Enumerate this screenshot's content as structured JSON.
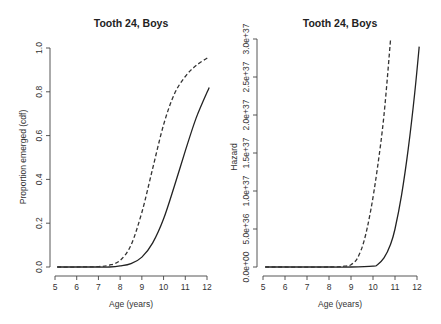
{
  "chart_data": [
    {
      "type": "line",
      "title": "Tooth 24, Boys",
      "xlabel": "Age (years)",
      "ylabel": "Proportion emerged (cdf)",
      "xlim": [
        5,
        12
      ],
      "ylim": [
        0,
        1
      ],
      "x_ticks": [
        "5",
        "6",
        "7",
        "8",
        "9",
        "10",
        "11",
        "12"
      ],
      "y_ticks": [
        "0.0",
        "0.2",
        "0.4",
        "0.6",
        "0.8",
        "1.0"
      ],
      "grid": false,
      "legend": null,
      "x": [
        5.1,
        6,
        7,
        7.5,
        8,
        8.5,
        9,
        9.5,
        10,
        10.5,
        11,
        11.5,
        12.1
      ],
      "series": [
        {
          "name": "solid",
          "style": "solid",
          "values": [
            0.0,
            0.0,
            0.0,
            0.0,
            0.005,
            0.015,
            0.045,
            0.11,
            0.22,
            0.37,
            0.53,
            0.68,
            0.82
          ]
        },
        {
          "name": "dashed",
          "style": "dashed",
          "values": [
            0.0,
            0.0,
            0.002,
            0.008,
            0.03,
            0.1,
            0.25,
            0.45,
            0.65,
            0.79,
            0.87,
            0.92,
            0.96
          ]
        }
      ]
    },
    {
      "type": "line",
      "title": "Tooth 24, Boys",
      "xlabel": "Age (years)",
      "ylabel": "Hazard",
      "xlim": [
        5,
        12
      ],
      "ylim": [
        0,
        3e+37
      ],
      "x_ticks": [
        "5",
        "6",
        "7",
        "8",
        "9",
        "10",
        "11",
        "12"
      ],
      "y_ticks": [
        "0.0e+00",
        "5.0e+36",
        "1.0e+37",
        "1.5e+37",
        "2.0e+37",
        "2.5e+37",
        "3.0e+37"
      ],
      "grid": false,
      "legend": null,
      "series": [
        {
          "name": "solid",
          "style": "solid",
          "x": [
            5.1,
            8,
            9,
            10,
            10.2,
            10.5,
            10.8,
            11,
            11.3,
            11.6,
            11.9,
            12.1
          ],
          "values": [
            0,
            0,
            0,
            1e+35,
            3e+35,
            1.2e+36,
            3e+36,
            5e+36,
            9.5e+36,
            1.55e+37,
            2.3e+37,
            2.9e+37
          ]
        },
        {
          "name": "dashed",
          "style": "dashed",
          "x": [
            5.1,
            8,
            8.7,
            9,
            9.3,
            9.6,
            9.9,
            10.2,
            10.5,
            10.8
          ],
          "values": [
            0,
            0,
            1e+35,
            3e+35,
            1.2e+36,
            3.5e+36,
            7.5e+36,
            1.3e+37,
            2e+37,
            3e+37
          ]
        }
      ]
    }
  ]
}
